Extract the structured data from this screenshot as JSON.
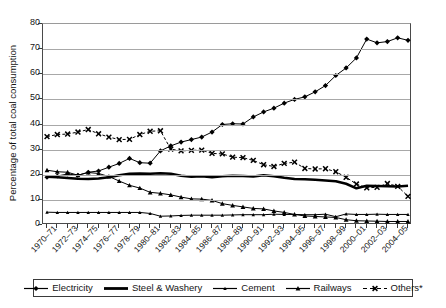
{
  "chart_data": {
    "type": "line",
    "title": "",
    "xlabel": "",
    "ylabel": "Percentage of total coal consumption",
    "ylim": [
      0,
      80
    ],
    "yticks": [
      0,
      10,
      20,
      30,
      40,
      50,
      60,
      70,
      80
    ],
    "grid": true,
    "legend_position": "bottom",
    "footnote": "*",
    "x": [
      "1970–71",
      "1971–72",
      "1972–73",
      "1973–74",
      "1974–75",
      "1975–76",
      "1976–77",
      "1977–78",
      "1978–79",
      "1979–80",
      "1980–81",
      "1981–82",
      "1982–83",
      "1983–84",
      "1984–85",
      "1985–86",
      "1986–87",
      "1987–88",
      "1988–89",
      "1989–90",
      "1990–91",
      "1991–92",
      "1992–93",
      "1993–94",
      "1994–95",
      "1995–96",
      "1996–97",
      "1997–98",
      "1998–99",
      "1999–00",
      "2000–01",
      "2001–02",
      "2002–03",
      "2003–04",
      "2004–05",
      "2005–06"
    ],
    "xtick_labels_shown": [
      "1970–71",
      "1972–73",
      "1974–75",
      "1976–77",
      "1978–79",
      "1980–81",
      "1982–83",
      "1984–85",
      "1986–87",
      "1988–89",
      "1990–91",
      "1992–93",
      "1994–95",
      "1996–97",
      "1998–99",
      "2000–01",
      "2002–03",
      "2004–05"
    ],
    "series": [
      {
        "name": "Electricity",
        "marker": "diamond",
        "line": "solid-thin",
        "color": "#000000",
        "values": [
          19.0,
          19.5,
          20.3,
          19.8,
          21.0,
          21.5,
          23.0,
          24.5,
          26.5,
          24.8,
          24.6,
          29.5,
          31.5,
          33.0,
          34.0,
          35.0,
          37.0,
          40.0,
          40.3,
          40.2,
          43.0,
          45.0,
          46.5,
          48.5,
          50.0,
          51.0,
          53.0,
          55.5,
          59.5,
          62.5,
          66.5,
          74.0,
          72.5,
          73.0,
          74.5,
          73.5
        ]
      },
      {
        "name": "Steel & Washery",
        "marker": "none",
        "line": "solid-thick",
        "color": "#000000",
        "values": [
          19.2,
          19.0,
          18.7,
          18.4,
          18.3,
          18.5,
          19.0,
          19.8,
          20.4,
          20.5,
          20.4,
          20.6,
          20.4,
          19.6,
          19.2,
          19.4,
          19.0,
          19.4,
          19.6,
          19.5,
          19.3,
          19.8,
          19.4,
          18.8,
          18.3,
          18.2,
          18.0,
          17.7,
          17.4,
          16.4,
          14.6,
          15.6,
          15.5,
          15.4,
          15.3,
          15.6
        ]
      },
      {
        "name": "Cement",
        "marker": "small-tri",
        "line": "solid-thin",
        "color": "#000000",
        "values": [
          5.1,
          5.0,
          5.0,
          5.0,
          5.0,
          5.0,
          5.0,
          5.0,
          5.0,
          5.0,
          4.6,
          3.5,
          3.6,
          3.8,
          3.9,
          3.9,
          3.9,
          3.9,
          4.0,
          4.1,
          4.1,
          4.1,
          4.3,
          4.2,
          4.2,
          4.1,
          4.1,
          4.3,
          3.3,
          4.4,
          4.2,
          4.2,
          4.3,
          4.2,
          4.2,
          4.2
        ]
      },
      {
        "name": "Railways",
        "marker": "triangle",
        "line": "solid-thin",
        "color": "#000000",
        "values": [
          21.8,
          21.2,
          21.0,
          19.8,
          20.9,
          20.5,
          19.3,
          17.5,
          15.8,
          14.7,
          13.0,
          12.6,
          12.0,
          11.1,
          10.4,
          10.3,
          9.8,
          8.5,
          7.8,
          7.2,
          6.6,
          6.4,
          5.6,
          5.0,
          4.2,
          3.6,
          3.4,
          3.2,
          3.0,
          2.1,
          1.7,
          1.6,
          1.5,
          1.4,
          1.4,
          1.4
        ]
      },
      {
        "name": "Others*",
        "marker": "x",
        "line": "dashed",
        "color": "#000000",
        "values": [
          35.2,
          36.0,
          36.2,
          37.0,
          38.0,
          36.3,
          35.0,
          34.0,
          34.1,
          36.0,
          37.3,
          37.5,
          30.2,
          29.5,
          29.7,
          29.8,
          28.5,
          28.3,
          27.0,
          26.8,
          25.7,
          24.0,
          23.3,
          24.5,
          25.0,
          22.5,
          22.3,
          22.4,
          21.2,
          19.0,
          16.3,
          14.8,
          15.0,
          16.5,
          15.4,
          11.4
        ]
      }
    ]
  },
  "legend": {
    "items": [
      {
        "label": "Electricity",
        "marker": "diamond",
        "line": "solid-thin"
      },
      {
        "label": "Steel & Washery",
        "marker": "none",
        "line": "solid-thick"
      },
      {
        "label": "Cement",
        "marker": "small-tri",
        "line": "solid-thin"
      },
      {
        "label": "Railways",
        "marker": "triangle",
        "line": "solid-thin"
      },
      {
        "label": "Others*",
        "marker": "x",
        "line": "dashed"
      }
    ]
  }
}
